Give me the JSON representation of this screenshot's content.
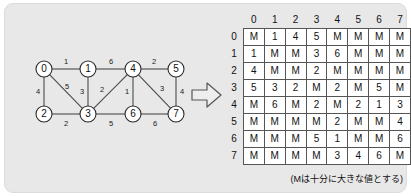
{
  "diagram": {
    "arrow_icon": "right-arrow-icon",
    "caption": "(Mは十分に大きな値とする)"
  },
  "graph": {
    "nodes": [
      {
        "id": "0",
        "label": "0",
        "x": 30,
        "y": 29
      },
      {
        "id": "1",
        "label": "1",
        "x": 74,
        "y": 29
      },
      {
        "id": "2",
        "label": "2",
        "x": 30,
        "y": 74
      },
      {
        "id": "3",
        "label": "3",
        "x": 74,
        "y": 74
      },
      {
        "id": "4",
        "label": "4",
        "x": 119,
        "y": 29
      },
      {
        "id": "5",
        "label": "5",
        "x": 162,
        "y": 29
      },
      {
        "id": "6",
        "label": "6",
        "x": 119,
        "y": 74
      },
      {
        "id": "7",
        "label": "7",
        "x": 162,
        "y": 74
      }
    ],
    "edges": [
      {
        "from": "0",
        "to": "1",
        "weight": "1",
        "lx": 52,
        "ly": 21
      },
      {
        "from": "0",
        "to": "2",
        "weight": "4",
        "lx": 24,
        "ly": 51
      },
      {
        "from": "0",
        "to": "3",
        "weight": "5",
        "lx": 53,
        "ly": 46
      },
      {
        "from": "1",
        "to": "3",
        "weight": "3",
        "lx": 68,
        "ly": 51
      },
      {
        "from": "1",
        "to": "4",
        "weight": "6",
        "lx": 97,
        "ly": 21
      },
      {
        "from": "2",
        "to": "3",
        "weight": "2",
        "lx": 52,
        "ly": 83
      },
      {
        "from": "3",
        "to": "4",
        "weight": "2",
        "lx": 88,
        "ly": 49
      },
      {
        "from": "3",
        "to": "6",
        "weight": "5",
        "lx": 97,
        "ly": 83
      },
      {
        "from": "4",
        "to": "5",
        "weight": "2",
        "lx": 140,
        "ly": 21
      },
      {
        "from": "4",
        "to": "6",
        "weight": "1",
        "lx": 113,
        "ly": 51
      },
      {
        "from": "4",
        "to": "7",
        "weight": "3",
        "lx": 148,
        "ly": 48
      },
      {
        "from": "5",
        "to": "7",
        "weight": "4",
        "lx": 168,
        "ly": 51
      },
      {
        "from": "6",
        "to": "7",
        "weight": "6",
        "lx": 141,
        "ly": 83
      }
    ]
  },
  "matrix": {
    "col_headers": [
      "0",
      "1",
      "2",
      "3",
      "4",
      "5",
      "6",
      "7"
    ],
    "row_headers": [
      "0",
      "1",
      "2",
      "3",
      "4",
      "5",
      "6",
      "7"
    ],
    "rows": [
      [
        "M",
        "1",
        "4",
        "5",
        "M",
        "M",
        "M",
        "M"
      ],
      [
        "1",
        "M",
        "M",
        "3",
        "6",
        "M",
        "M",
        "M"
      ],
      [
        "4",
        "M",
        "M",
        "2",
        "M",
        "M",
        "M",
        "M"
      ],
      [
        "5",
        "3",
        "2",
        "M",
        "2",
        "M",
        "5",
        "M"
      ],
      [
        "M",
        "6",
        "M",
        "2",
        "M",
        "2",
        "1",
        "3"
      ],
      [
        "M",
        "M",
        "M",
        "M",
        "2",
        "M",
        "M",
        "4"
      ],
      [
        "M",
        "M",
        "M",
        "5",
        "1",
        "M",
        "M",
        "6"
      ],
      [
        "M",
        "M",
        "M",
        "M",
        "3",
        "4",
        "6",
        "M"
      ]
    ]
  },
  "colors": {
    "panel_bg": "#e8e8e8",
    "cell_bg": "#ffffff",
    "line": "#4a4a4a",
    "text": "#111111"
  }
}
